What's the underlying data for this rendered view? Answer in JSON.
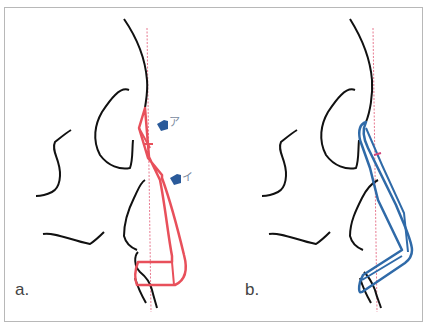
{
  "figure": {
    "panels": [
      {
        "label": "a.",
        "outline_color": "#e8505b",
        "markers": [
          {
            "label": "ア",
            "color": "#2a5a9a"
          },
          {
            "label": "イ",
            "color": "#2a5a9a"
          }
        ]
      },
      {
        "label": "b.",
        "outline_color": "#2f6aa8",
        "inner_mark_color": "#d0457a"
      }
    ],
    "reference_line_color": "#e87a90",
    "profile_line_color": "#111111",
    "border_color": "#b8b8b8"
  }
}
